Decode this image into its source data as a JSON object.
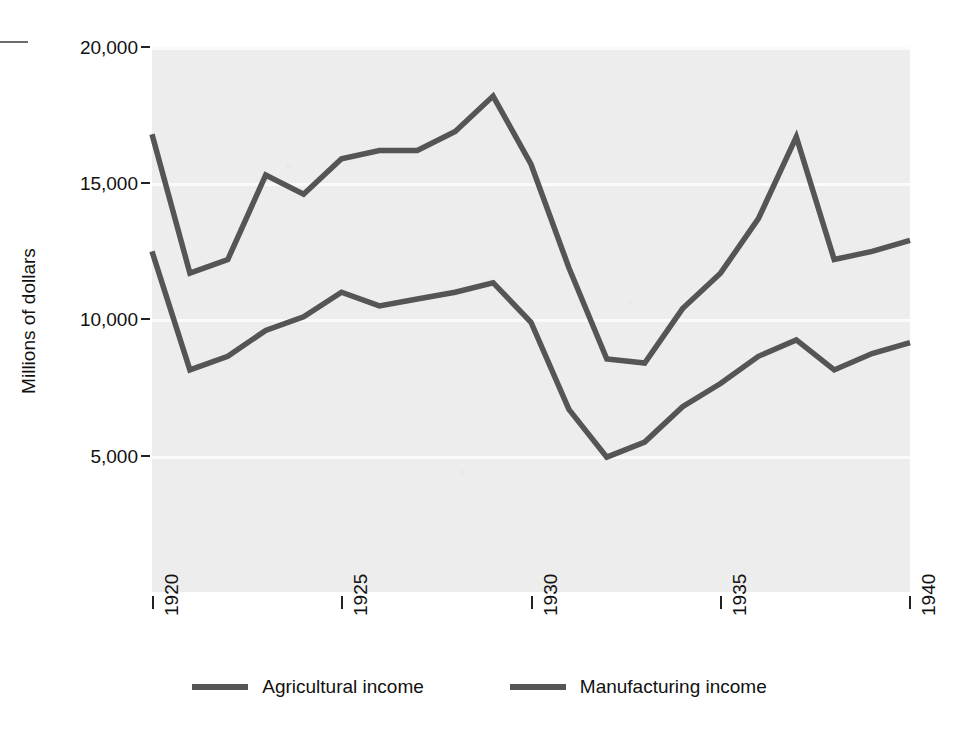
{
  "chart_data": {
    "type": "line",
    "title": "",
    "subtitle": "",
    "xlabel": "",
    "ylabel": "Millions of dollars",
    "x": [
      1920,
      1921,
      1922,
      1923,
      1924,
      1925,
      1926,
      1927,
      1928,
      1929,
      1930,
      1931,
      1932,
      1933,
      1934,
      1935,
      1936,
      1937,
      1938,
      1939,
      1940
    ],
    "xlim": [
      1920,
      1940
    ],
    "ylim": [
      0,
      20000
    ],
    "xticks": [
      1920,
      1925,
      1930,
      1935,
      1940
    ],
    "xtick_labels": [
      "1920",
      "1925",
      "1930",
      "1935",
      "1940"
    ],
    "yticks": [
      5000,
      10000,
      15000,
      20000
    ],
    "ytick_labels": [
      "5,000",
      "10,000",
      "15,000",
      "20,000"
    ],
    "grid": "horizontal-white-on-gray",
    "legend_position": "bottom-center",
    "series": [
      {
        "name": "Agricultural income",
        "color": "#555555",
        "values": [
          16800,
          11700,
          12200,
          15300,
          14600,
          15900,
          16200,
          16200,
          16900,
          18200,
          15700,
          11900,
          8550,
          8400,
          10400,
          11700,
          13700,
          16700,
          12200,
          12500,
          12900
        ]
      },
      {
        "name": "Manufacturing income",
        "color": "#555555",
        "values": [
          12500,
          8150,
          8650,
          9600,
          10100,
          11000,
          10500,
          10750,
          11000,
          11350,
          9900,
          6700,
          4950,
          5500,
          6800,
          7650,
          8650,
          9250,
          8150,
          8750,
          9150
        ]
      }
    ]
  },
  "axis": {
    "y_title": "Millions of dollars"
  },
  "legend": {
    "items": [
      {
        "label": "Agricultural income"
      },
      {
        "label": "Manufacturing income"
      }
    ]
  }
}
